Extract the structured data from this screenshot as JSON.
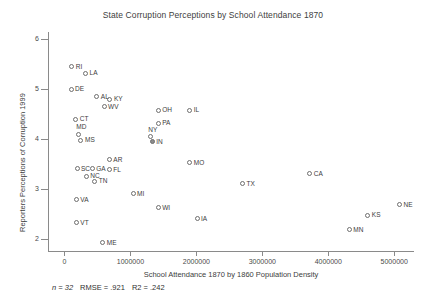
{
  "chart_data": {
    "type": "scatter",
    "title": "State Corruption Perceptions by School Attendance 1870",
    "xlabel": "School Attendance 1870 by 1860 Population Density",
    "ylabel": "Reporters Perceptions of Corruption 1999",
    "xlim": [
      -250000,
      5300000
    ],
    "ylim": [
      1.75,
      6.15
    ],
    "grid": false,
    "legend": false,
    "xticks": [
      0,
      1000000,
      2000000,
      3000000,
      4000000,
      5000000
    ],
    "xtick_labels": [
      "0",
      "1000000",
      "2000000",
      "3000000",
      "4000000",
      "5000000"
    ],
    "yticks": [
      2,
      3,
      4,
      5,
      6
    ],
    "ytick_labels": [
      "2",
      "3",
      "4",
      "5",
      "6"
    ],
    "annotations": {
      "n": "n = 32",
      "rmse": "RMSE = .921",
      "r2": "R2 = .242"
    },
    "points": [
      {
        "label": "RI",
        "x": 110000,
        "y": 5.45,
        "label_pos": "right",
        "filled": false
      },
      {
        "label": "LA",
        "x": 320000,
        "y": 5.32,
        "label_pos": "right",
        "filled": false
      },
      {
        "label": "DE",
        "x": 100000,
        "y": 5.0,
        "label_pos": "right",
        "filled": false
      },
      {
        "label": "AL",
        "x": 490000,
        "y": 4.85,
        "label_pos": "right",
        "filled": false
      },
      {
        "label": "KY",
        "x": 690000,
        "y": 4.8,
        "label_pos": "right",
        "filled": false
      },
      {
        "label": "WV",
        "x": 600000,
        "y": 4.65,
        "label_pos": "right",
        "filled": false
      },
      {
        "label": "CT",
        "x": 170000,
        "y": 4.4,
        "label_pos": "right",
        "filled": false
      },
      {
        "label": "OH",
        "x": 1420000,
        "y": 4.58,
        "label_pos": "right",
        "filled": false
      },
      {
        "label": "IL",
        "x": 1900000,
        "y": 4.58,
        "label_pos": "right",
        "filled": false
      },
      {
        "label": "PA",
        "x": 1420000,
        "y": 4.32,
        "label_pos": "right",
        "filled": false
      },
      {
        "label": "MD",
        "x": 210000,
        "y": 4.1,
        "label_pos": "above",
        "filled": false
      },
      {
        "label": "MS",
        "x": 250000,
        "y": 3.98,
        "label_pos": "right",
        "filled": false
      },
      {
        "label": "NY",
        "x": 1300000,
        "y": 4.05,
        "label_pos": "above",
        "filled": false
      },
      {
        "label": "IN",
        "x": 1330000,
        "y": 3.95,
        "label_pos": "right",
        "filled": true
      },
      {
        "label": "AR",
        "x": 680000,
        "y": 3.58,
        "label_pos": "right",
        "filled": false
      },
      {
        "label": "MO",
        "x": 1900000,
        "y": 3.52,
        "label_pos": "right",
        "filled": false
      },
      {
        "label": "SC",
        "x": 190000,
        "y": 3.4,
        "label_pos": "right",
        "filled": false
      },
      {
        "label": "GA",
        "x": 420000,
        "y": 3.4,
        "label_pos": "right",
        "filled": false
      },
      {
        "label": "FL",
        "x": 680000,
        "y": 3.38,
        "label_pos": "right",
        "filled": false
      },
      {
        "label": "NC",
        "x": 330000,
        "y": 3.25,
        "label_pos": "right",
        "filled": false
      },
      {
        "label": "TN",
        "x": 460000,
        "y": 3.15,
        "label_pos": "right",
        "filled": false
      },
      {
        "label": "CA",
        "x": 3720000,
        "y": 3.3,
        "label_pos": "right",
        "filled": false
      },
      {
        "label": "TX",
        "x": 2700000,
        "y": 3.1,
        "label_pos": "right",
        "filled": false
      },
      {
        "label": "MI",
        "x": 1040000,
        "y": 2.9,
        "label_pos": "right",
        "filled": false
      },
      {
        "label": "VA",
        "x": 180000,
        "y": 2.78,
        "label_pos": "right",
        "filled": false
      },
      {
        "label": "NE",
        "x": 5080000,
        "y": 2.68,
        "label_pos": "right",
        "filled": false
      },
      {
        "label": "WI",
        "x": 1420000,
        "y": 2.62,
        "label_pos": "right",
        "filled": false
      },
      {
        "label": "KS",
        "x": 4600000,
        "y": 2.47,
        "label_pos": "right",
        "filled": false
      },
      {
        "label": "IA",
        "x": 2010000,
        "y": 2.4,
        "label_pos": "right",
        "filled": false
      },
      {
        "label": "VT",
        "x": 180000,
        "y": 2.32,
        "label_pos": "right",
        "filled": false
      },
      {
        "label": "MN",
        "x": 4320000,
        "y": 2.18,
        "label_pos": "right",
        "filled": false
      },
      {
        "label": "ME",
        "x": 580000,
        "y": 1.92,
        "label_pos": "right",
        "filled": false
      }
    ]
  }
}
